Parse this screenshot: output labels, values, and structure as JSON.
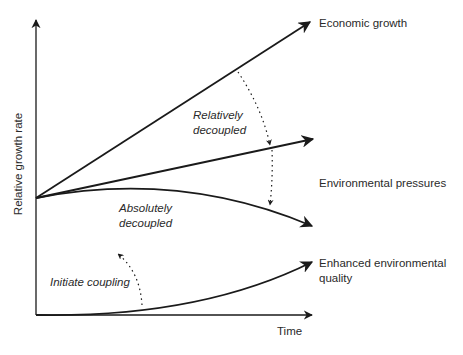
{
  "diagram": {
    "axes": {
      "y_label": "Relative growth rate",
      "x_label": "Time"
    },
    "curves": {
      "economic_growth": "Economic growth",
      "environmental_pressures": "Environmental pressures",
      "enhanced_quality_line1": "Enhanced environmental",
      "enhanced_quality_line2": "quality"
    },
    "annotations": {
      "relatively_line1": "Relatively",
      "relatively_line2": "decoupled",
      "absolutely_line1": "Absolutely",
      "absolutely_line2": "decoupled",
      "initiate": "Initiate coupling"
    },
    "colors": {
      "line": "#1a1a1a",
      "text": "#2a2a2a",
      "background": "#ffffff"
    }
  }
}
